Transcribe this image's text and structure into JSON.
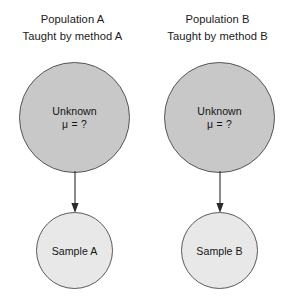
{
  "figure": {
    "background_color": "#ffffff",
    "population_fill": "#c8c8c8",
    "population_stroke": "#555555",
    "sample_fill": "#e8e8e8",
    "sample_stroke": "#5a5a5a",
    "arrow_color": "#2b2b2b"
  },
  "groups": [
    {
      "id": "a",
      "caption_line1": "Population A",
      "caption_line2": "Taught by method A",
      "population": {
        "label_line1": "Unknown",
        "label_line2": "μ = ?"
      },
      "arrow": {
        "icon": "down-arrow-icon"
      },
      "sample": {
        "label": "Sample A"
      }
    },
    {
      "id": "b",
      "caption_line1": "Population B",
      "caption_line2": "Taught by method B",
      "population": {
        "label_line1": "Unknown",
        "label_line2": "μ = ?"
      },
      "arrow": {
        "icon": "down-arrow-icon"
      },
      "sample": {
        "label": "Sample B"
      }
    }
  ]
}
